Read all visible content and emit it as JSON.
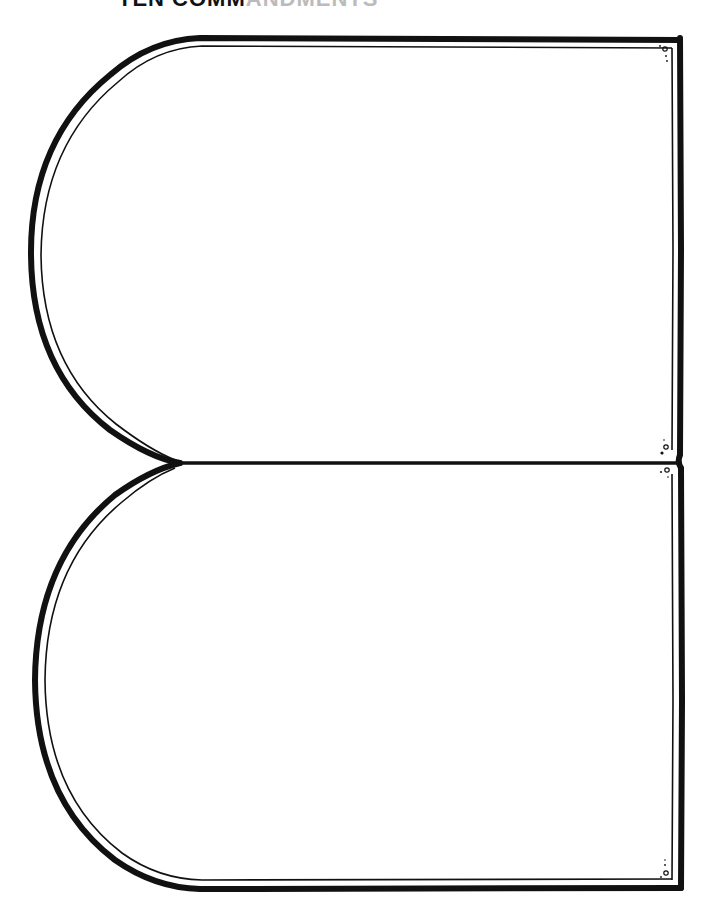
{
  "header": {
    "title_visible": "TEN COMM",
    "title_faded": "ANDMENTS"
  },
  "worksheet": {
    "type": "tablet outline template",
    "tablets": [
      {
        "name": "upper-tablet",
        "content": ""
      },
      {
        "name": "lower-tablet",
        "content": ""
      }
    ],
    "colors": {
      "outline": "#111111",
      "background": "#ffffff"
    }
  }
}
